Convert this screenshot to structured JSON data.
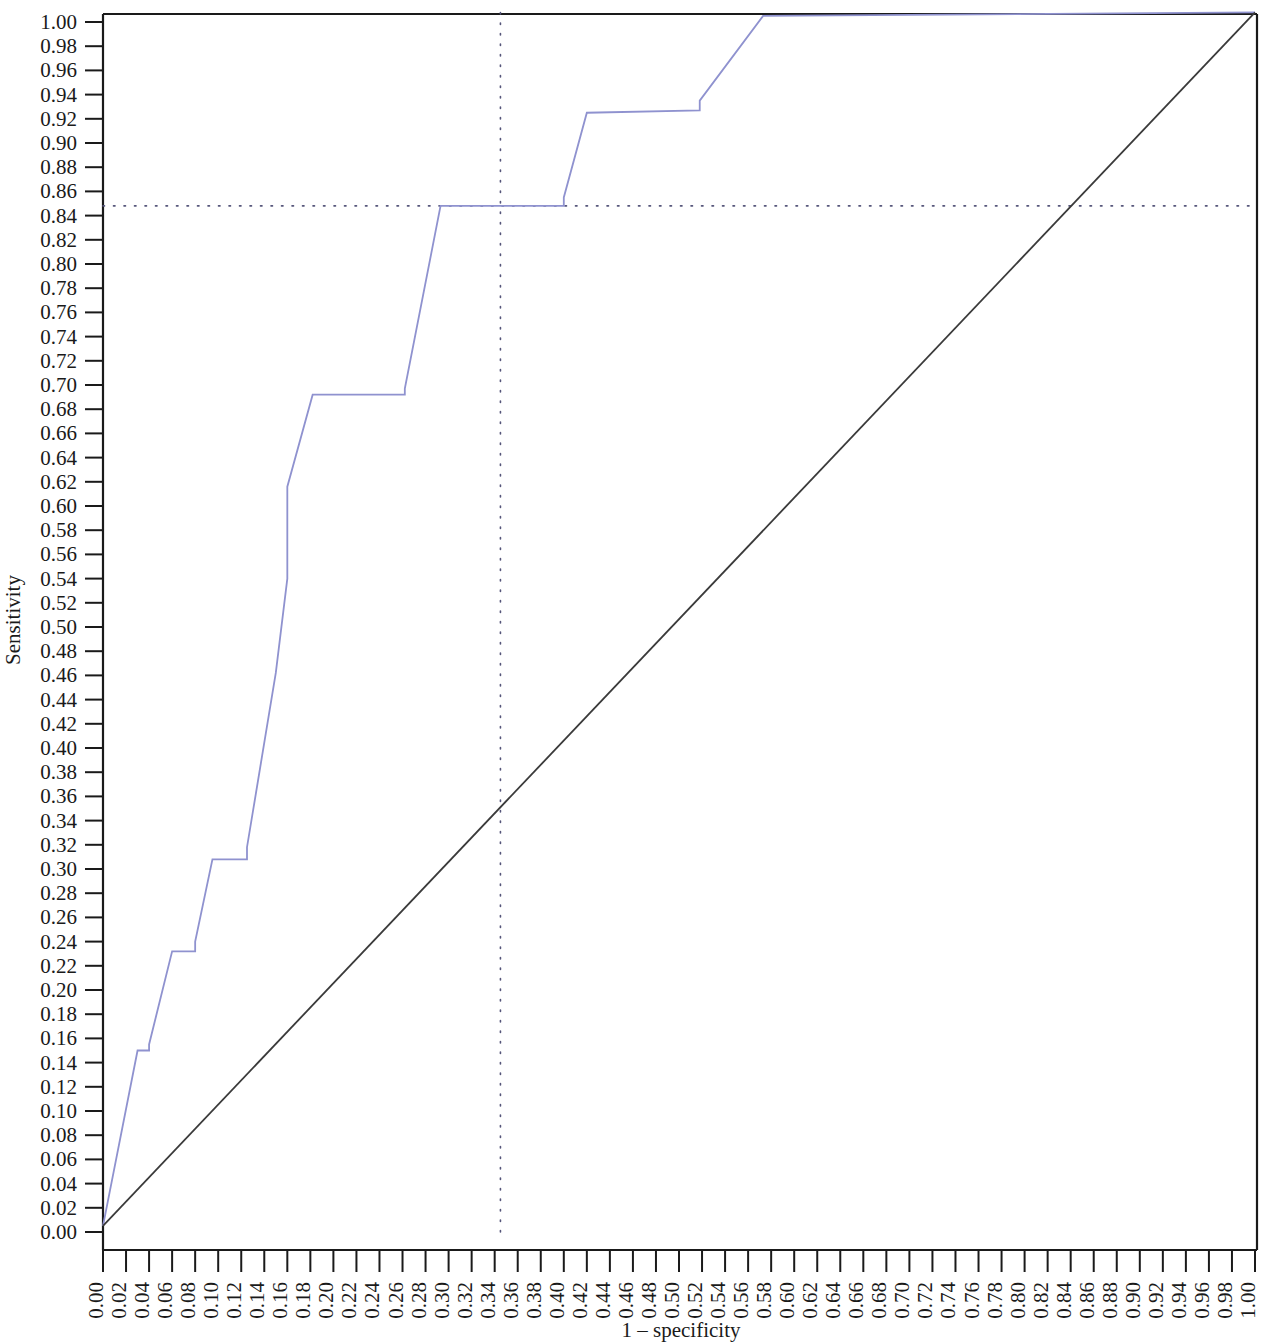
{
  "figure": {
    "name": "roc-curve-figure",
    "background_color": "#ffffff"
  },
  "chart_data": {
    "type": "line",
    "title": "",
    "subtitle": "",
    "xlabel": "1 – specificity",
    "ylabel": "Sensitivity",
    "xlim": [
      0.0,
      1.0
    ],
    "ylim": [
      0.0,
      1.0
    ],
    "grid": false,
    "legend": null,
    "legend_position": "none",
    "xticks": [
      "0.00",
      "0.02",
      "0.04",
      "0.06",
      "0.08",
      "0.10",
      "0.12",
      "0.14",
      "0.16",
      "0.18",
      "0.20",
      "0.22",
      "0.24",
      "0.26",
      "0.28",
      "0.30",
      "0.32",
      "0.34",
      "0.36",
      "0.38",
      "0.40",
      "0.42",
      "0.44",
      "0.46",
      "0.48",
      "0.50",
      "0.52",
      "0.54",
      "0.56",
      "0.58",
      "0.60",
      "0.62",
      "0.64",
      "0.66",
      "0.68",
      "0.70",
      "0.72",
      "0.74",
      "0.76",
      "0.78",
      "0.80",
      "0.82",
      "0.84",
      "0.86",
      "0.88",
      "0.90",
      "0.92",
      "0.94",
      "0.96",
      "0.98",
      "1.00"
    ],
    "xtick_values": [
      0.0,
      0.02,
      0.04,
      0.06,
      0.08,
      0.1,
      0.12,
      0.14,
      0.16,
      0.18,
      0.2,
      0.22,
      0.24,
      0.26,
      0.28,
      0.3,
      0.32,
      0.34,
      0.36,
      0.38,
      0.4,
      0.42,
      0.44,
      0.46,
      0.48,
      0.5,
      0.52,
      0.54,
      0.56,
      0.58,
      0.6,
      0.62,
      0.64,
      0.66,
      0.68,
      0.7,
      0.72,
      0.74,
      0.76,
      0.78,
      0.8,
      0.82,
      0.84,
      0.86,
      0.88,
      0.9,
      0.92,
      0.94,
      0.96,
      0.98,
      1.0
    ],
    "yticks": [
      "0.00",
      "0.02",
      "0.04",
      "0.06",
      "0.08",
      "0.10",
      "0.12",
      "0.14",
      "0.16",
      "0.18",
      "0.20",
      "0.22",
      "0.24",
      "0.26",
      "0.28",
      "0.30",
      "0.32",
      "0.34",
      "0.36",
      "0.38",
      "0.40",
      "0.42",
      "0.44",
      "0.46",
      "0.48",
      "0.50",
      "0.52",
      "0.54",
      "0.56",
      "0.58",
      "0.60",
      "0.62",
      "0.64",
      "0.66",
      "0.68",
      "0.70",
      "0.72",
      "0.74",
      "0.76",
      "0.78",
      "0.80",
      "0.82",
      "0.84",
      "0.86",
      "0.88",
      "0.90",
      "0.92",
      "0.94",
      "0.96",
      "0.98",
      "1.00"
    ],
    "ytick_values": [
      0.0,
      0.02,
      0.04,
      0.06,
      0.08,
      0.1,
      0.12,
      0.14,
      0.16,
      0.18,
      0.2,
      0.22,
      0.24,
      0.26,
      0.28,
      0.3,
      0.32,
      0.34,
      0.36,
      0.38,
      0.4,
      0.42,
      0.44,
      0.46,
      0.48,
      0.5,
      0.52,
      0.54,
      0.56,
      0.58,
      0.6,
      0.62,
      0.64,
      0.66,
      0.68,
      0.7,
      0.72,
      0.74,
      0.76,
      0.78,
      0.8,
      0.82,
      0.84,
      0.86,
      0.88,
      0.9,
      0.92,
      0.94,
      0.96,
      0.98,
      1.0
    ],
    "series": [
      {
        "name": "roc-curve",
        "color": "#8f92cf",
        "width": 1.8,
        "style": "solid",
        "points": [
          [
            0.0,
            0.005
          ],
          [
            0.03,
            0.15
          ],
          [
            0.04,
            0.15
          ],
          [
            0.04,
            0.155
          ],
          [
            0.06,
            0.232
          ],
          [
            0.08,
            0.232
          ],
          [
            0.08,
            0.24
          ],
          [
            0.095,
            0.308
          ],
          [
            0.125,
            0.308
          ],
          [
            0.125,
            0.318
          ],
          [
            0.15,
            0.462
          ],
          [
            0.16,
            0.54
          ],
          [
            0.16,
            0.616
          ],
          [
            0.182,
            0.692
          ],
          [
            0.262,
            0.692
          ],
          [
            0.262,
            0.697
          ],
          [
            0.293,
            0.848
          ],
          [
            0.4,
            0.848
          ],
          [
            0.4,
            0.855
          ],
          [
            0.42,
            0.925
          ],
          [
            0.518,
            0.927
          ],
          [
            0.518,
            0.935
          ],
          [
            0.573,
            1.005
          ],
          [
            1.0,
            1.008
          ]
        ]
      },
      {
        "name": "reference-diagonal",
        "color": "#3a3a3a",
        "width": 1.8,
        "style": "solid",
        "points": [
          [
            0.0,
            0.005
          ],
          [
            1.0,
            1.008
          ]
        ]
      }
    ],
    "annotations": [
      {
        "name": "horizontal-cutoff-line",
        "type": "hline",
        "y": 0.848,
        "x_from": 0.0,
        "x_to": 1.0,
        "style": "dotted",
        "color": "#55557a"
      },
      {
        "name": "vertical-cutoff-line",
        "type": "vline",
        "x": 0.345,
        "y_from": 0.0,
        "y_to": 1.008,
        "style": "dotted",
        "color": "#55557a"
      }
    ],
    "frame": {
      "top_line": true,
      "right_line": true,
      "left_axis": true,
      "bottom_axis": true,
      "color": "#1a1a1a"
    }
  }
}
